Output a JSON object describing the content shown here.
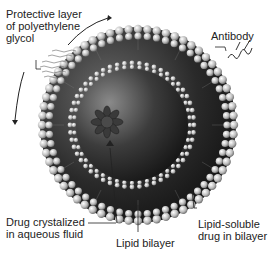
{
  "diagram": {
    "labels": {
      "peg_line1": "Protective layer",
      "peg_line2": "of polyethylene",
      "peg_line3": "glycol",
      "antibody": "Antibody",
      "drug_aqueous_line1": "Drug crystalized",
      "drug_aqueous_line2": "in aqueous fluid",
      "lipid_bilayer": "Lipid bilayer",
      "lipid_drug_line1": "Lipid-soluble",
      "lipid_drug_line2": "drug in bilayer"
    },
    "colors": {
      "background": "#ffffff",
      "sphere_dark": "#1a1a1a",
      "sphere_mid": "#555555",
      "lipid_head": "#d8d8d8",
      "text": "#222222"
    }
  }
}
